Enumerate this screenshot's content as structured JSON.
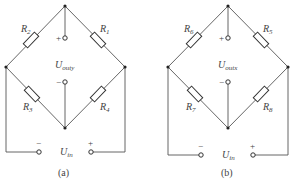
{
  "figures": [
    {
      "caption": "(a)",
      "resistors": {
        "top_left": "2",
        "top_right": "1",
        "bottom_left": "3",
        "bottom_right": "4"
      },
      "resistor_prefix": "R",
      "output_label": "U",
      "output_sub": "outy",
      "input_label": "U",
      "input_sub": "in",
      "plus": "+",
      "minus": "−"
    },
    {
      "caption": "(b)",
      "resistors": {
        "top_left": "6",
        "top_right": "5",
        "bottom_left": "7",
        "bottom_right": "8"
      },
      "resistor_prefix": "R",
      "output_label": "U",
      "output_sub": "outx",
      "input_label": "U",
      "input_sub": "in",
      "plus": "+",
      "minus": "−"
    }
  ]
}
